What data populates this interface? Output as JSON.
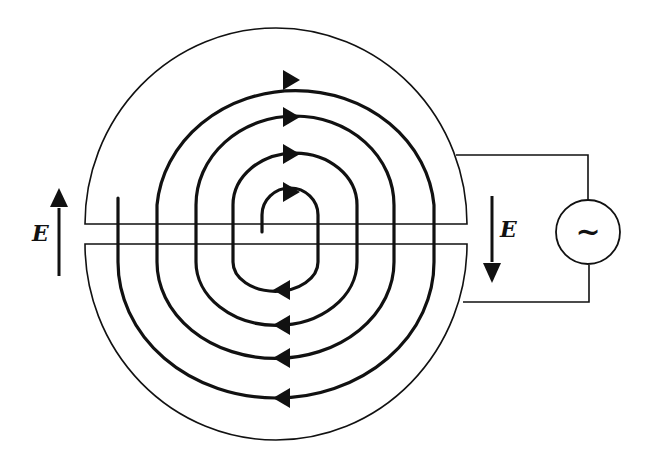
{
  "diagram": {
    "type": "cyclotron",
    "labels": {
      "field_left": "E",
      "field_right": "E",
      "ac_source_symbol": "~"
    },
    "components": [
      {
        "id": "upper-dee",
        "description": "Upper D-shaped electrode"
      },
      {
        "id": "lower-dee",
        "description": "Lower D-shaped electrode"
      },
      {
        "id": "spiral-path",
        "description": "Spiral trajectory of charged particle with direction arrows",
        "loops": 4
      },
      {
        "id": "ac-source",
        "description": "Alternating voltage source connected to both dees"
      },
      {
        "id": "field-arrow-left",
        "direction": "up"
      },
      {
        "id": "field-arrow-right",
        "direction": "down"
      }
    ],
    "colors": {
      "stroke": "#111111",
      "background": "#ffffff"
    }
  }
}
